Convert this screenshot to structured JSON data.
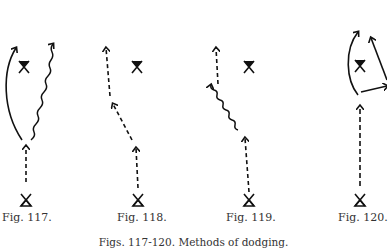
{
  "figures": [
    {
      "label": "Fig. 117.",
      "description": "Straight dribble then curved run left around defender and wavy dribble run right"
    },
    {
      "label": "Fig. 118.",
      "description": "Dashed pass forward, diagonal dashed run left, dashed run forward"
    },
    {
      "label": "Fig. 119.",
      "description": "Dashed pass forward, wavy dribble diagonal left, dashed run forward"
    },
    {
      "label": "Fig. 120.",
      "description": "Dashed pass forward, curved run around defender to the left and angled run right"
    }
  ],
  "caption": "Figs. 117-120. Methods of dodging.",
  "legend": {
    "defender_symbol": "filled-triangle-over-x",
    "attacker_symbol": "x-over-open-triangle",
    "pass": "dashed line",
    "dribble": "wavy line",
    "run": "solid line"
  }
}
